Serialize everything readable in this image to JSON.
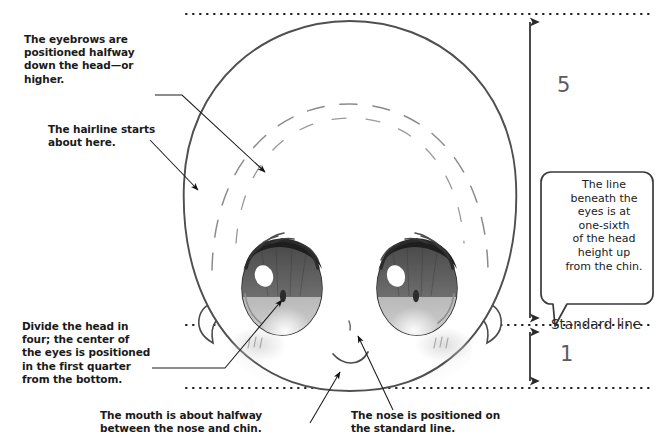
{
  "figure": {
    "ink_color": "#1a1a1a",
    "guide_color": "#222222",
    "dim_color": "#5b5b5b"
  },
  "annotations": [
    {
      "id": "eyebrows-note",
      "text": "The eyebrows are\npositioned halfway\ndown the head—or\nhigher."
    },
    {
      "id": "hairline-note",
      "text": "The hairline starts\nabout here."
    },
    {
      "id": "divide-note",
      "text": "Divide the head in\nfour; the center of\nthe eyes is positioned\nin the first quarter\nfrom the bottom."
    },
    {
      "id": "mouth-note",
      "text": "The mouth is about halfway\nbetween the nose and chin."
    },
    {
      "id": "nose-note",
      "text": "The nose is positioned on\nthe standard line."
    }
  ],
  "callout": {
    "id": "eye-line-callout",
    "text": "The line\nbeneath the\neyes is at\none-sixth\nof the head\nheight up\nfrom the chin."
  },
  "measurements": {
    "upper_label": "5",
    "lower_label": "1",
    "standard_line_label": "Standard line"
  },
  "guide_lines": [
    {
      "id": "top-guide",
      "y": 14
    },
    {
      "id": "standard-line-guide",
      "y": 325
    },
    {
      "id": "bottom-guide",
      "y": 388
    }
  ],
  "face_parts": [
    {
      "id": "head-outline"
    },
    {
      "id": "hairline-arc"
    },
    {
      "id": "left-eye"
    },
    {
      "id": "right-eye"
    },
    {
      "id": "left-ear"
    },
    {
      "id": "right-ear"
    },
    {
      "id": "left-blush"
    },
    {
      "id": "right-blush"
    },
    {
      "id": "nose-tick"
    },
    {
      "id": "mouth-curve"
    }
  ]
}
